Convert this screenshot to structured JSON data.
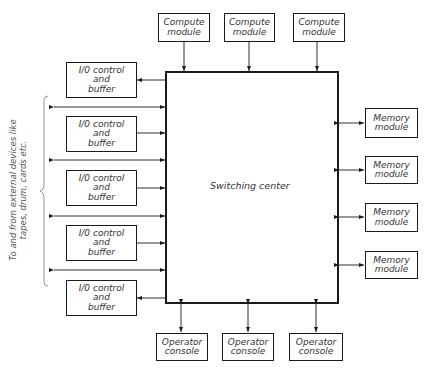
{
  "diagram": {
    "switching_center": {
      "label": "Switching center"
    },
    "compute_modules": [
      {
        "line1": "Compute",
        "line2": "module"
      },
      {
        "line1": "Compute",
        "line2": "module"
      },
      {
        "line1": "Compute",
        "line2": "module"
      }
    ],
    "io_units": [
      {
        "line1": "I/0 control",
        "line2": "and",
        "line3": "buffer"
      },
      {
        "line1": "I/0 control",
        "line2": "and",
        "line3": "buffer"
      },
      {
        "line1": "I/0 control",
        "line2": "and",
        "line3": "buffer"
      },
      {
        "line1": "I/0 control",
        "line2": "and",
        "line3": "buffer"
      },
      {
        "line1": "I/0 control",
        "line2": "and",
        "line3": "buffer"
      }
    ],
    "memory_modules": [
      {
        "line1": "Memory",
        "line2": "module"
      },
      {
        "line1": "Memory",
        "line2": "module"
      },
      {
        "line1": "Memory",
        "line2": "module"
      },
      {
        "line1": "Memory",
        "line2": "module"
      }
    ],
    "operator_consoles": [
      {
        "line1": "Operator",
        "line2": "console"
      },
      {
        "line1": "Operator",
        "line2": "console"
      },
      {
        "line1": "Operator",
        "line2": "console"
      }
    ],
    "external_devices_note": {
      "line1": "To and from external devices like",
      "line2": "tapes, drum, cards etc."
    }
  }
}
